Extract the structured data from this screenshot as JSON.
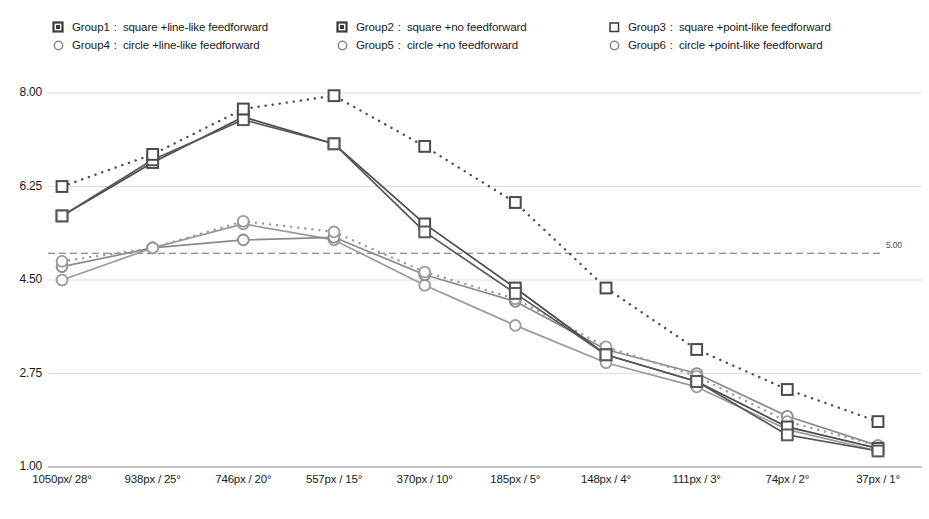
{
  "legend": {
    "rows": [
      [
        {
          "marker": "square-filled-outline-marker",
          "name": "Group1",
          "sep": ":",
          "desc": "square +line-like feedforward",
          "color": "#3a3a3a"
        },
        {
          "marker": "square-filled-outline-marker",
          "name": "Group2",
          "sep": ":",
          "desc": "square +no feedforward",
          "color": "#3a3a3a"
        },
        {
          "marker": "square-open-marker",
          "name": "Group3",
          "sep": ":",
          "desc": "square +point-like feedforward",
          "color": "#3a3a3a"
        }
      ],
      [
        {
          "marker": "circle-open-marker",
          "name": "Group4",
          "sep": ":",
          "desc": "circle +line-like feedforward",
          "color": "#8a8a8a"
        },
        {
          "marker": "circle-open-marker",
          "name": "Group5",
          "sep": ":",
          "desc": "circle +no feedforward",
          "color": "#8a8a8a"
        },
        {
          "marker": "circle-open-marker",
          "name": "Group6",
          "sep": ":",
          "desc": "circle +point-like feedforward",
          "color": "#8a8a8a"
        }
      ]
    ]
  },
  "reference_line": {
    "value": 5.0,
    "label": "5.00"
  },
  "chart_data": {
    "type": "line",
    "title": "",
    "xlabel": "",
    "ylabel": "",
    "ylim": [
      1.0,
      8.0
    ],
    "yticks": [
      "1.00",
      "2.75",
      "4.50",
      "6.25",
      "8.00"
    ],
    "ytick_values": [
      1.0,
      2.75,
      4.5,
      6.25,
      8.0
    ],
    "grid": true,
    "legend_position": "top",
    "categories": [
      "1050px/ 28°",
      "938px / 25°",
      "746px / 20°",
      "557px / 15°",
      "370px / 10°",
      "185px / 5°",
      "148px / 4°",
      "111px / 3°",
      "74px / 2°",
      "37px / 1°"
    ],
    "annotations": [
      {
        "text": "5.00",
        "type": "reference-line",
        "y": 5.0
      }
    ],
    "series": [
      {
        "name": "Group1",
        "label": "Group1: square +line-like feedforward",
        "marker": "square",
        "linestyle": "solid",
        "color": "#4a4a4a",
        "values": [
          5.7,
          6.7,
          7.55,
          7.05,
          5.55,
          4.35,
          3.1,
          2.6,
          1.75,
          1.35
        ]
      },
      {
        "name": "Group2",
        "label": "Group2: square +no feedforward",
        "marker": "square",
        "linestyle": "solid",
        "color": "#585858",
        "values": [
          5.7,
          6.75,
          7.5,
          7.05,
          5.4,
          4.25,
          3.1,
          2.6,
          1.6,
          1.3
        ]
      },
      {
        "name": "Group3",
        "label": "Group3: square +point-like feedforward",
        "marker": "square",
        "linestyle": "dotted",
        "color": "#4a4a4a",
        "values": [
          6.25,
          6.85,
          7.7,
          7.95,
          7.0,
          5.95,
          4.35,
          3.2,
          2.45,
          1.85
        ]
      },
      {
        "name": "Group4",
        "label": "Group4: circle +line-like feedforward",
        "marker": "circle",
        "linestyle": "solid",
        "color": "#9a9a9a",
        "values": [
          4.5,
          5.1,
          5.55,
          5.25,
          4.4,
          3.65,
          2.95,
          2.5,
          1.7,
          1.3
        ]
      },
      {
        "name": "Group5",
        "label": "Group5: circle +no feedforward",
        "marker": "circle",
        "linestyle": "solid",
        "color": "#8a8a8a",
        "values": [
          4.75,
          5.1,
          5.25,
          5.3,
          4.6,
          4.1,
          3.2,
          2.75,
          1.95,
          1.4
        ]
      },
      {
        "name": "Group6",
        "label": "Group6: circle +point-like feedforward",
        "marker": "circle",
        "linestyle": "dotted",
        "color": "#9a9a9a",
        "values": [
          4.85,
          5.1,
          5.6,
          5.4,
          4.65,
          4.15,
          3.25,
          2.7,
          1.85,
          1.4
        ]
      }
    ]
  }
}
